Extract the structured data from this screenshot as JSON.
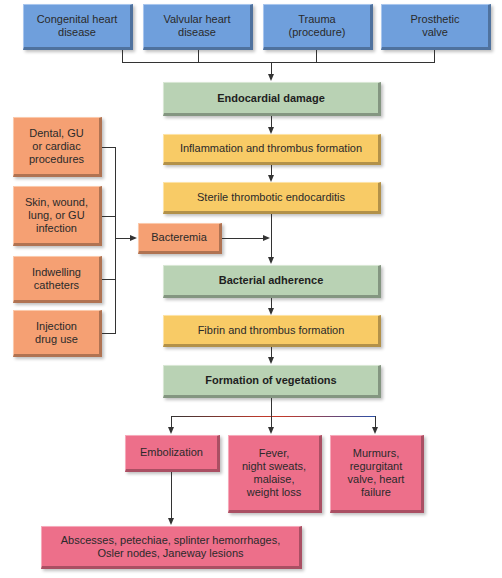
{
  "colors": {
    "cause_box": "#6f9fdc",
    "key_step_box": "#b9d2b4",
    "process_box": "#f8cb66",
    "risk_box": "#f5a073",
    "outcome_box": "#ed6f8a",
    "connector": "#333333"
  },
  "causes": [
    {
      "label": "Congenital heart\ndisease"
    },
    {
      "label": "Valvular heart\ndisease"
    },
    {
      "label": "Trauma\n(procedure)"
    },
    {
      "label": "Prosthetic\nvalve"
    }
  ],
  "pathway": {
    "endocardial_damage": "Endocardial damage",
    "inflammation": "Inflammation and thrombus formation",
    "sterile": "Sterile thrombotic endocarditis",
    "bacterial_adherence": "Bacterial adherence",
    "fibrin": "Fibrin and thrombus formation",
    "vegetations": "Formation of vegetations"
  },
  "risk_factors": [
    {
      "label": "Dental, GU\nor cardiac\nprocedures"
    },
    {
      "label": "Skin, wound,\nlung, or GU\ninfection"
    },
    {
      "label": "Indwelling\ncatheters"
    },
    {
      "label": "Injection\ndrug use"
    }
  ],
  "bacteremia": "Bacteremia",
  "outcomes": [
    {
      "label": "Embolization"
    },
    {
      "label": "Fever,\nnight sweats,\nmalaise,\nweight loss"
    },
    {
      "label": "Murmurs,\nregurgitant\nvalve, heart\nfailure"
    }
  ],
  "embolization_result": "Abscesses, petechiae, splinter hemorrhages,\nOsler nodes, Janeway lesions"
}
